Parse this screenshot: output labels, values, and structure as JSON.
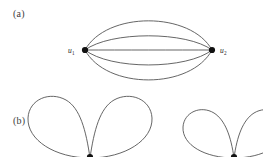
{
  "figure": {
    "width": 263,
    "height": 157,
    "background_color": "#ffffff",
    "stroke_color": "#4a4a4a",
    "vertex_color": "#111111"
  },
  "panels": [
    {
      "key": "a",
      "label": "(a)",
      "description": "multigraph with five parallel edges between two vertices",
      "vertices": [
        {
          "id": "u1",
          "label_main": "u",
          "label_sub": "1",
          "x": 85,
          "y": 50
        },
        {
          "id": "u2",
          "label_main": "u",
          "label_sub": "2",
          "x": 212,
          "y": 50
        }
      ],
      "edge_count": 5,
      "edges": [
        {
          "id": "edge-1",
          "bulge": -37,
          "apex_y": 13
        },
        {
          "id": "edge-2",
          "bulge": -13,
          "apex_y": 37
        },
        {
          "id": "edge-3",
          "bulge": 0,
          "apex_y": 50
        },
        {
          "id": "edge-4",
          "bulge": 14,
          "apex_y": 64
        },
        {
          "id": "edge-5",
          "bulge": 38,
          "apex_y": 88
        }
      ]
    },
    {
      "key": "b",
      "label": "(b)",
      "description": "bouquet graphs of loops, cropped at the bottom edge",
      "groups": [
        {
          "id": "bouquet-left",
          "base_x": 90,
          "base_y": 157,
          "loops": [
            {
              "id": "loop-left-1",
              "side": "left",
              "radius_x": 31,
              "radius_y": 30
            },
            {
              "id": "loop-left-2",
              "side": "right",
              "radius_x": 31,
              "radius_y": 30
            }
          ]
        },
        {
          "id": "bouquet-right",
          "base_x": 234,
          "base_y": 157,
          "loops": [
            {
              "id": "loop-right-1",
              "side": "left",
              "radius_x": 26,
              "radius_y": 22
            },
            {
              "id": "loop-right-2",
              "side": "right",
              "radius_x": 26,
              "radius_y": 22
            }
          ]
        }
      ]
    }
  ]
}
